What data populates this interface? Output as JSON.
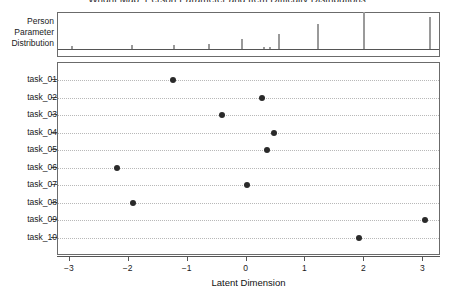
{
  "title": "Wright Map: Person Parameter and Item Difficulty Distributions",
  "chart_data": {
    "type": "scatter",
    "title": "Wright Map: Person Parameter and Item Difficulty Distributions",
    "xlabel": "Latent Dimension",
    "ylabel": "",
    "xlim": [
      -3.2,
      3.3
    ],
    "xticks": [
      -3,
      -2,
      -1,
      0,
      1,
      2,
      3
    ],
    "xticklabels": [
      "−3",
      "−2",
      "−1",
      "0",
      "1",
      "2",
      "3"
    ],
    "grid": true,
    "grid_style": "dotted",
    "panels": [
      {
        "name": "person-parameter-distribution",
        "label": "Person\nParameter\nDistribution",
        "label_lines": [
          "Person",
          "Parameter",
          "Distribution"
        ],
        "type": "spike-histogram",
        "bins": [
          {
            "x": -2.96,
            "height": 0.1
          },
          {
            "x": -1.95,
            "height": 0.13
          },
          {
            "x": -1.23,
            "height": 0.12
          },
          {
            "x": -0.63,
            "height": 0.16
          },
          {
            "x": -0.07,
            "height": 0.3
          },
          {
            "x": 0.3,
            "height": 0.07
          },
          {
            "x": 0.39,
            "height": 0.07
          },
          {
            "x": 0.55,
            "height": 0.42
          },
          {
            "x": 1.21,
            "height": 0.68
          },
          {
            "x": 2.0,
            "height": 1.0
          },
          {
            "x": 3.12,
            "height": 0.88
          }
        ]
      },
      {
        "name": "item-difficulty-scatter",
        "type": "scatter",
        "categories": [
          "task_01",
          "task_02",
          "task_03",
          "task_04",
          "task_05",
          "task_06",
          "task_07",
          "task_08",
          "task_09",
          "task_10"
        ],
        "values": [
          -1.25,
          0.27,
          -0.41,
          0.47,
          0.34,
          -2.2,
          0.01,
          -1.92,
          3.02,
          1.91
        ]
      }
    ]
  },
  "colors": {
    "point": "#2a2a2a",
    "spike": "#9a9a9a",
    "grid": "#b8b8b8",
    "axis": "#555555",
    "border": "#6b6b6b",
    "text": "#1a1a1a",
    "background": "#ffffff"
  }
}
